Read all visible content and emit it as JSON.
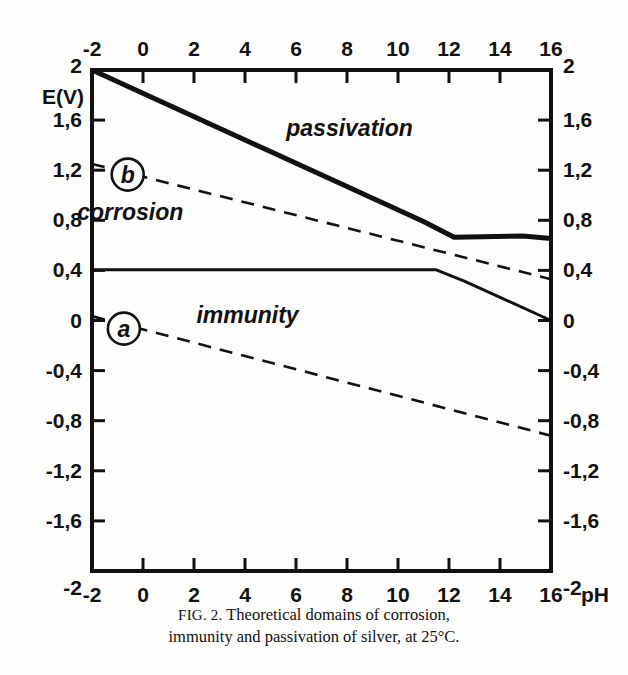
{
  "figure": {
    "caption_prefix": "FIG. 2.",
    "caption_line1": "Theoretical domains of corrosion,",
    "caption_line2": "immunity and passivation of silver, at 25°C."
  },
  "chart_data": {
    "type": "line",
    "title": "Theoretical domains of corrosion, immunity and passivation of silver, at 25°C",
    "xlabel": "pH",
    "ylabel": "E(V)",
    "xlim": [
      -2,
      16
    ],
    "ylim": [
      -2,
      2
    ],
    "grid": false,
    "legend": "none",
    "axis_style": "frame with ticks on all four sides; x labelled top and bottom, E(V) labelled left and right",
    "decimal_separator": ",",
    "xticks": [
      -2,
      0,
      2,
      4,
      6,
      8,
      10,
      12,
      14,
      16
    ],
    "xticklabels": [
      "-2",
      "0",
      "2",
      "4",
      "6",
      "8",
      "10",
      "12",
      "14",
      "16"
    ],
    "yticks": [
      2,
      1.6,
      1.2,
      0.8,
      0.4,
      0,
      -0.4,
      -0.8,
      -1.2,
      -1.6,
      -2
    ],
    "yticklabels": [
      "2",
      "1,6",
      "1,2",
      "0,8",
      "0,4",
      "0",
      "-0,4",
      "-0,8",
      "-1,2",
      "-1,6",
      "-2"
    ],
    "x_axis_unit_label": "pH",
    "series": [
      {
        "name": "passivation-boundary",
        "style": "solid-thick",
        "points": [
          [
            -2,
            2.0
          ],
          [
            11.0,
            0.79
          ],
          [
            12.2,
            0.665
          ],
          [
            14.9,
            0.675
          ],
          [
            16,
            0.655
          ]
        ]
      },
      {
        "name": "immunity-boundary",
        "style": "solid-thin",
        "points": [
          [
            -2,
            0.405
          ],
          [
            11.5,
            0.405
          ],
          [
            12.6,
            0.315
          ],
          [
            16,
            0.0
          ]
        ]
      },
      {
        "name": "b",
        "style": "dashed",
        "label": "b",
        "description": "oxygen line O2/H2O",
        "points": [
          [
            -2,
            1.25
          ],
          [
            16,
            0.33
          ]
        ]
      },
      {
        "name": "a",
        "style": "dashed",
        "label": "a",
        "description": "hydrogen line H+/H2",
        "points": [
          [
            -2,
            0.035
          ],
          [
            16,
            -0.92
          ]
        ]
      }
    ],
    "annotations": [
      {
        "text": "passivation",
        "x": 8.1,
        "y": 1.47,
        "style": "italic"
      },
      {
        "text": "corrosion",
        "x": -0.5,
        "y": 0.8,
        "style": "italic"
      },
      {
        "text": "immunity",
        "x": 4.1,
        "y": -0.02,
        "style": "italic"
      },
      {
        "text": "b",
        "x": -0.6,
        "y": 1.165,
        "style": "circled-italic"
      },
      {
        "text": "a",
        "x": -0.75,
        "y": -0.065,
        "style": "circled-italic"
      }
    ]
  },
  "colors": {
    "ink": "#111111",
    "paper": "#fdfdfb"
  }
}
